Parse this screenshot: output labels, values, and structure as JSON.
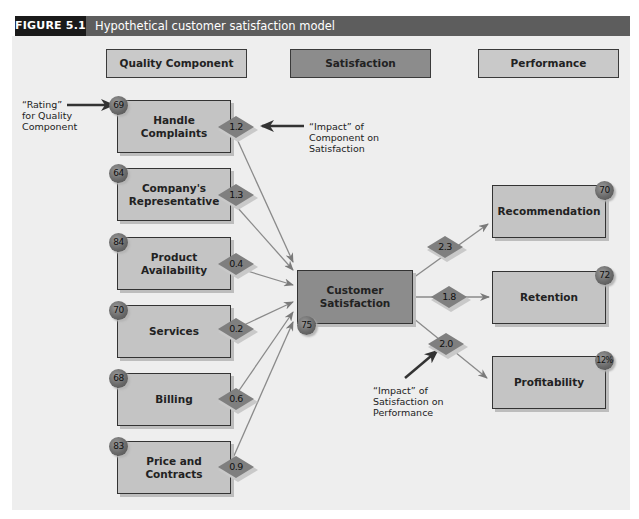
{
  "figure": {
    "label": "FIGURE 5.1",
    "title": "Hypothetical customer satisfaction model"
  },
  "column_headers": {
    "quality": "Quality Component",
    "satisfaction": "Satisfaction",
    "performance": "Performance"
  },
  "quality_components": [
    {
      "name": "Handle Complaints",
      "line1": "Handle",
      "line2": "Complaints",
      "rating": "69",
      "impact": "1.2"
    },
    {
      "name": "Company's Representative",
      "line1": "Company's",
      "line2": "Representative",
      "rating": "64",
      "impact": "1.3"
    },
    {
      "name": "Product Availability",
      "line1": "Product",
      "line2": "Availability",
      "rating": "84",
      "impact": "0.4"
    },
    {
      "name": "Services",
      "line1": "Services",
      "line2": "",
      "rating": "70",
      "impact": "0.2"
    },
    {
      "name": "Billing",
      "line1": "Billing",
      "line2": "",
      "rating": "68",
      "impact": "0.6"
    },
    {
      "name": "Price and Contracts",
      "line1": "Price and",
      "line2": "Contracts",
      "rating": "83",
      "impact": "0.9"
    }
  ],
  "satisfaction": {
    "line1": "Customer",
    "line2": "Satisfaction",
    "rating": "75"
  },
  "performance": [
    {
      "name": "Recommendation",
      "rating": "70",
      "impact": "2.3"
    },
    {
      "name": "Retention",
      "rating": "72",
      "impact": "1.8"
    },
    {
      "name": "Profitability",
      "rating": "12%",
      "impact": "2.0"
    }
  ],
  "annotations": {
    "rating": [
      "“Rating”",
      "for Quality",
      "Component"
    ],
    "impact_component": [
      "“Impact” of",
      "Component on",
      "Satisfaction"
    ],
    "impact_satisfaction": [
      "“Impact” of",
      "Satisfaction on",
      "Performance"
    ]
  },
  "colors": {
    "header_label_bg": "#1a1a1a",
    "header_bar_bg": "#5d5d5d",
    "panel_bg": "#eeeeee",
    "light_box": "#c4c4c4",
    "dark_box": "#8c8c8c",
    "arrow": "#7a7a7a"
  }
}
